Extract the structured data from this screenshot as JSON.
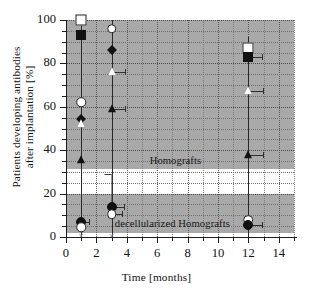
{
  "chart_data": {
    "type": "scatter",
    "title": "",
    "xlabel": "Time [months]",
    "ylabel_line1": "Patients developing antibodies",
    "ylabel_line2": "after implantation [%]",
    "xlim": [
      0,
      15
    ],
    "ylim": [
      0,
      100
    ],
    "xticks": [
      0,
      2,
      4,
      6,
      8,
      10,
      12,
      14
    ],
    "xtick_labels": [
      "0",
      "2",
      "4",
      "6",
      "8",
      "10",
      "12",
      "14"
    ],
    "yticks": [
      0,
      20,
      40,
      60,
      80,
      100
    ],
    "ytick_labels": [
      "0",
      "20",
      "40",
      "60",
      "80",
      "100"
    ],
    "grid": true,
    "legend_position": "none",
    "annotations": [
      {
        "text": "Homografts",
        "x": 7.2,
        "y": 35.5
      },
      {
        "text": "decellularized Homografts",
        "x": 7.0,
        "y": 6.5
      }
    ],
    "shaded_bands": [
      {
        "y0": 31.5,
        "y1": 100.0,
        "color": "#a9a9a9",
        "label": "Homografts"
      },
      {
        "y0": 2.0,
        "y1": 19.8,
        "color": "#a9a9a9",
        "label": "decellularized Homografts"
      }
    ],
    "series": [
      {
        "name": "Homografts open square",
        "marker": "sq-o",
        "points": [
          {
            "x": 1,
            "y": 100,
            "xerr_right": 0
          },
          {
            "x": 12,
            "y": 87,
            "xerr_right": 0
          }
        ]
      },
      {
        "name": "Homografts filled square",
        "marker": "sq-f",
        "points": [
          {
            "x": 1,
            "y": 93,
            "xerr_right": 0
          },
          {
            "x": 12,
            "y": 83,
            "xerr_right": 0.9
          }
        ]
      },
      {
        "name": "Homografts open circle",
        "marker": "ci-o",
        "points": [
          {
            "x": 1,
            "y": 62
          },
          {
            "x": 3,
            "y": 96
          },
          {
            "x": 12,
            "y": 8
          }
        ]
      },
      {
        "name": "Homografts filled diamond",
        "marker": "di",
        "points": [
          {
            "x": 1,
            "y": 54.5
          },
          {
            "x": 3,
            "y": 86
          }
        ]
      },
      {
        "name": "Homografts open triangle",
        "marker": "tri-o",
        "points": [
          {
            "x": 1,
            "y": 52
          },
          {
            "x": 3,
            "y": 76,
            "xerr_right": 0.85
          },
          {
            "x": 12,
            "y": 67.5,
            "xerr_right": 0.95
          }
        ]
      },
      {
        "name": "Homografts filled triangle",
        "marker": "tri-f",
        "points": [
          {
            "x": 1,
            "y": 35.5
          },
          {
            "x": 3,
            "y": 59,
            "xerr_right": 0.85
          },
          {
            "x": 12,
            "y": 38,
            "xerr_right": 0.95
          }
        ]
      },
      {
        "name": "decellularized filled circle",
        "marker": "ci-f",
        "points": [
          {
            "x": 1,
            "y": 7,
            "xerr_right": 0.5
          },
          {
            "x": 3,
            "y": 14,
            "xerr_right": 0.8,
            "yerr_up": 15
          },
          {
            "x": 12,
            "y": 5.5,
            "xerr_right": 0.9
          }
        ]
      },
      {
        "name": "decellularized open circle lower",
        "marker": "ci-o",
        "points": [
          {
            "x": 1,
            "y": 4.5
          },
          {
            "x": 3,
            "y": 10.5,
            "xerr_right": 0.7
          }
        ]
      },
      {
        "name": "baseline crosses",
        "marker": "ex",
        "points": [
          {
            "x": 1,
            "y": 0.4
          },
          {
            "x": 3,
            "y": 0.4
          }
        ]
      }
    ],
    "stems": [
      {
        "x": 1,
        "y_bottom": 0,
        "y_top": 100
      },
      {
        "x": 3,
        "y_bottom": 0,
        "y_top": 100
      },
      {
        "x": 12,
        "y_bottom": 0,
        "y_top": 92
      }
    ]
  }
}
